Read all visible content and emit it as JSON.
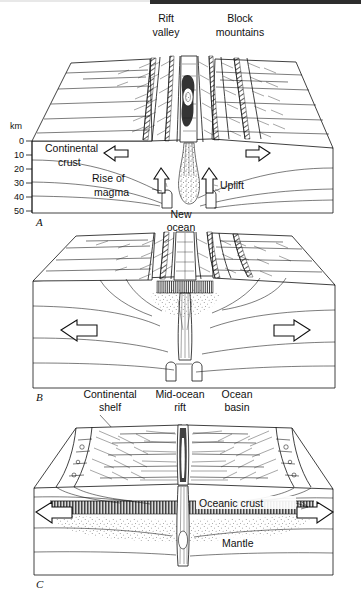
{
  "figure": {
    "style": "black line engraving on white",
    "background": "#ffffff",
    "ink": "#111111",
    "panels": [
      {
        "letter": "A",
        "caption": "Continental rifting stage",
        "labels": [
          {
            "name": "rift-valley",
            "text_lines": [
              "Rift",
              "valley"
            ],
            "x": 166,
            "y": 22
          },
          {
            "name": "block-mountains",
            "text_lines": [
              "Block",
              "mountains"
            ],
            "x": 240,
            "y": 22
          },
          {
            "name": "continental-crust",
            "text_lines": [
              "Continental",
              "crust"
            ],
            "x": 83,
            "y": 146
          },
          {
            "name": "rise-of-magma",
            "text_lines": [
              "Rise of",
              "magma"
            ],
            "x": 123,
            "y": 185,
            "leader": true
          },
          {
            "name": "uplift",
            "text_lines": [
              "Uplift"
            ],
            "x": 216,
            "y": 185
          }
        ],
        "scale": {
          "unit": "km",
          "ticks": [
            "0",
            "10",
            "20",
            "30",
            "40",
            "50"
          ]
        },
        "arrows": [
          {
            "name": "spread-arrow-left",
            "direction": "left"
          },
          {
            "name": "spread-arrow-right",
            "direction": "right"
          },
          {
            "name": "uplift-arrow-left",
            "direction": "up"
          },
          {
            "name": "uplift-arrow-right",
            "direction": "up"
          }
        ]
      },
      {
        "letter": "B",
        "caption": "New ocean stage",
        "labels": [
          {
            "name": "new-ocean",
            "text_lines": [
              "New",
              "ocean"
            ],
            "x": 180,
            "y": 215
          }
        ],
        "arrows": [
          {
            "name": "spread-arrow-left",
            "direction": "left"
          },
          {
            "name": "spread-arrow-right",
            "direction": "right"
          }
        ]
      },
      {
        "letter": "C",
        "caption": "Mature ocean basin stage",
        "labels": [
          {
            "name": "continental-shelf",
            "text_lines": [
              "Continental",
              "shelf"
            ],
            "x": 110,
            "y": 395,
            "leader": true
          },
          {
            "name": "mid-ocean-rift",
            "text_lines": [
              "Mid-ocean",
              "rift"
            ],
            "x": 180,
            "y": 395
          },
          {
            "name": "ocean-basin",
            "text_lines": [
              "Ocean",
              "basin"
            ],
            "x": 236,
            "y": 395
          },
          {
            "name": "oceanic-crust",
            "text_lines": [
              "Oceanic crust"
            ],
            "x": 263,
            "y": 505,
            "leader": true
          },
          {
            "name": "mantle",
            "text_lines": [
              "Mantle"
            ],
            "x": 244,
            "y": 545
          }
        ],
        "arrows": [
          {
            "name": "spread-arrow-left",
            "direction": "left"
          },
          {
            "name": "spread-arrow-right",
            "direction": "right"
          }
        ]
      }
    ],
    "text": {
      "rift_valley_1": "Rift",
      "rift_valley_2": "valley",
      "block_mountains_1": "Block",
      "block_mountains_2": "mountains",
      "continental_crust_1": "Continental",
      "continental_crust_2": "crust",
      "rise_of_magma_1": "Rise of",
      "rise_of_magma_2": "magma",
      "uplift": "Uplift",
      "new_ocean_1": "New",
      "new_ocean_2": "ocean",
      "continental_shelf_1": "Continental",
      "continental_shelf_2": "shelf",
      "mid_ocean_rift_1": "Mid-ocean",
      "mid_ocean_rift_2": "rift",
      "ocean_basin_1": "Ocean",
      "ocean_basin_2": "basin",
      "oceanic_crust": "Oceanic crust",
      "mantle": "Mantle",
      "km": "km",
      "t0": "0",
      "t10": "10",
      "t20": "20",
      "t30": "30",
      "t40": "40",
      "t50": "50",
      "letter_a": "A",
      "letter_b": "B",
      "letter_c": "C"
    }
  }
}
